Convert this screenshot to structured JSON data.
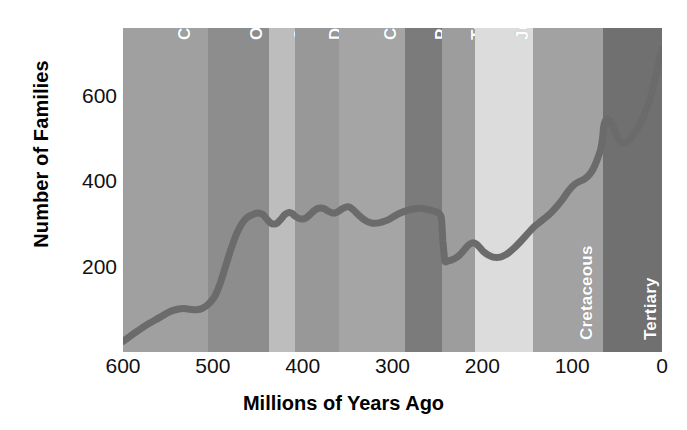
{
  "chart_data": {
    "type": "line",
    "title": "",
    "subtitle": "",
    "xlabel": "Millions of Years Ago",
    "ylabel": "Number of Families",
    "xlim": [
      600,
      0
    ],
    "ylim": [
      0,
      760
    ],
    "x_reversed": true,
    "grid": false,
    "legend": "none",
    "xticks": [
      600,
      500,
      400,
      300,
      200,
      100,
      0
    ],
    "xticklabels": [
      "600",
      "500",
      "400",
      "300",
      "200",
      "100",
      "0"
    ],
    "yticks": [
      200,
      400,
      600
    ],
    "yticklabels": [
      "200",
      "400",
      "600"
    ],
    "line_color": "#6b6b6b",
    "line_width": 7,
    "series": [
      {
        "name": "Number of marine families",
        "x": [
          600,
          590,
          580,
          570,
          560,
          552,
          545,
          538,
          532,
          525,
          518,
          512,
          505,
          498,
          492,
          486,
          480,
          474,
          468,
          462,
          456,
          450,
          444,
          440,
          436,
          432,
          428,
          424,
          420,
          416,
          412,
          408,
          404,
          400,
          396,
          392,
          388,
          384,
          380,
          376,
          372,
          368,
          364,
          360,
          356,
          352,
          348,
          344,
          340,
          336,
          332,
          328,
          324,
          320,
          315,
          310,
          305,
          300,
          295,
          290,
          285,
          280,
          275,
          270,
          265,
          260,
          255,
          250,
          248,
          246,
          245,
          244,
          242,
          238,
          234,
          230,
          226,
          222,
          218,
          214,
          210,
          206,
          202,
          198,
          194,
          190,
          186,
          182,
          178,
          174,
          170,
          164,
          158,
          152,
          146,
          140,
          134,
          128,
          122,
          116,
          110,
          104,
          98,
          92,
          86,
          80,
          76,
          72,
          68,
          66,
          65,
          63,
          60,
          56,
          52,
          48,
          44,
          40,
          34,
          28,
          22,
          16,
          10,
          5,
          0
        ],
        "y": [
          25,
          40,
          55,
          68,
          80,
          90,
          97,
          101,
          102,
          100,
          99,
          102,
          112,
          130,
          160,
          200,
          240,
          275,
          300,
          315,
          322,
          326,
          322,
          312,
          303,
          300,
          303,
          312,
          322,
          327,
          325,
          318,
          313,
          312,
          315,
          322,
          330,
          336,
          338,
          336,
          331,
          327,
          326,
          330,
          336,
          340,
          340,
          334,
          326,
          318,
          311,
          306,
          303,
          302,
          303,
          306,
          310,
          316,
          322,
          327,
          331,
          334,
          336,
          337,
          336,
          334,
          331,
          328,
          325,
          318,
          300,
          262,
          215,
          214,
          216,
          220,
          226,
          235,
          245,
          253,
          256,
          252,
          243,
          234,
          228,
          224,
          222,
          222,
          224,
          228,
          234,
          245,
          258,
          272,
          286,
          298,
          308,
          318,
          330,
          344,
          360,
          378,
          392,
          400,
          406,
          418,
          432,
          452,
          478,
          505,
          528,
          543,
          545,
          535,
          516,
          498,
          490,
          492,
          504,
          522,
          545,
          578,
          620,
          665,
          710
        ]
      }
    ],
    "period_bands": [
      {
        "name": "Cambrian",
        "start": 600,
        "end": 505,
        "color": "#a0a0a0",
        "label_color": "#ffffff"
      },
      {
        "name": "Ordovician",
        "start": 505,
        "end": 438,
        "color": "#8d8d8d",
        "label_color": "#ffffff"
      },
      {
        "name": "Silurian",
        "start": 438,
        "end": 408,
        "color": "#bdbdbd",
        "label_color": "#ffffff"
      },
      {
        "name": "Devonian",
        "start": 408,
        "end": 360,
        "color": "#989898",
        "label_color": "#ffffff"
      },
      {
        "name": "Carboniferous",
        "start": 360,
        "end": 286,
        "color": "#a5a5a5",
        "label_color": "#ffffff"
      },
      {
        "name": "Permian",
        "start": 286,
        "end": 245,
        "color": "#7b7b7b",
        "label_color": "#ffffff"
      },
      {
        "name": "Triassic",
        "start": 245,
        "end": 208,
        "color": "#9d9d9d",
        "label_color": "#ffffff"
      },
      {
        "name": "Jurassic",
        "start": 208,
        "end": 144,
        "color": "#dcdcdc",
        "label_color": "#ffffff"
      },
      {
        "name": "Cretaceous",
        "start": 144,
        "end": 66,
        "color": "#a2a2a2",
        "label_color": "#ffffff"
      },
      {
        "name": "Tertiary",
        "start": 66,
        "end": 0,
        "color": "#707070",
        "label_color": "#ffffff"
      }
    ]
  }
}
